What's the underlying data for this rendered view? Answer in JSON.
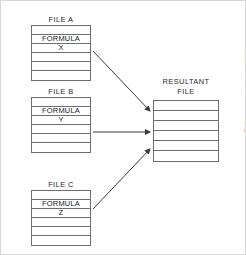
{
  "figure": {
    "copyright": "© Cengage Learning 2013"
  },
  "sources": [
    {
      "label": "FILE A",
      "formula_label": "FORMULA",
      "formula_name": "X",
      "rows": [
        "",
        "FORMULA",
        "X",
        "",
        "",
        ""
      ]
    },
    {
      "label": "FILE B",
      "formula_label": "FORMULA",
      "formula_name": "Y",
      "rows": [
        "",
        "FORMULA",
        "Y",
        "",
        "",
        ""
      ]
    },
    {
      "label": "FILE C",
      "formula_label": "FORMULA",
      "formula_name": "Z",
      "rows": [
        "",
        "FORMULA",
        "Z",
        "",
        "",
        ""
      ]
    }
  ],
  "resultant": {
    "title_line1": "RESULTANT",
    "title_line2": "FILE",
    "rows": [
      "",
      "",
      "",
      "",
      "",
      ""
    ]
  },
  "arrows": [
    {
      "name": "arrow-file-a-to-resultant",
      "from": "FILE A",
      "to": "RESULTANT FILE"
    },
    {
      "name": "arrow-file-b-to-resultant",
      "from": "FILE B",
      "to": "RESULTANT FILE"
    },
    {
      "name": "arrow-file-c-to-resultant",
      "from": "FILE C",
      "to": "RESULTANT FILE"
    }
  ],
  "colors": {
    "stroke": "#6e6e6e",
    "text": "#1a1a1a",
    "arrow": "#3a3a3a",
    "frame": "#d8d8d8"
  }
}
